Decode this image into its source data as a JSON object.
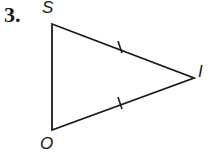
{
  "problem": {
    "number": "3."
  },
  "triangle": {
    "vertices": [
      {
        "label": "S",
        "x": 52,
        "y": 24
      },
      {
        "label": "I",
        "x": 194,
        "y": 78
      },
      {
        "label": "O",
        "x": 52,
        "y": 130
      }
    ],
    "congruent_sides": [
      "SI",
      "OI"
    ],
    "stroke_color": "#1a1a1a"
  }
}
